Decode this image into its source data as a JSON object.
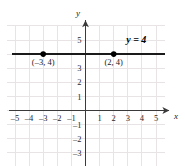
{
  "chart_data": {
    "type": "line",
    "title": "",
    "xlabel": "x",
    "ylabel": "y",
    "xlim": [
      -6,
      6
    ],
    "ylim": [
      -4,
      6
    ],
    "grid": true,
    "legend": "none",
    "x_tick_labels": [
      "–5",
      "–4",
      "–3",
      "–2",
      "–1",
      "1",
      "2",
      "3",
      "4",
      "5"
    ],
    "x_tick_values": [
      -5,
      -4,
      -3,
      -2,
      -1,
      1,
      2,
      3,
      4,
      5
    ],
    "y_tick_labels": [
      "5",
      "3",
      "2",
      "1",
      "–1",
      "–2",
      "–3"
    ],
    "y_tick_values": [
      5,
      3,
      2,
      1,
      -1,
      -2,
      -3
    ],
    "series": [
      {
        "name": "y = 4",
        "equation_label": "y = 4",
        "kind": "horizontal-line",
        "y_value": 4,
        "x_start": -5.2,
        "x_end": 5.6
      }
    ],
    "points": [
      {
        "x": -3,
        "y": 4,
        "label": "(–3, 4)"
      },
      {
        "x": 2,
        "y": 4,
        "label": "(2, 4)"
      }
    ],
    "annotations": [
      {
        "text": "y = 4",
        "x": 3.6,
        "y": 4.8
      }
    ],
    "colors": {
      "grid": "#e8e4e6",
      "axis": "#3a3a3a",
      "line": "#1a1a1a",
      "point": "#000000",
      "text": "#1a1a1a",
      "background": "#ffffff"
    }
  },
  "figure": {
    "x_axis_label": "x",
    "y_axis_label": "y"
  }
}
